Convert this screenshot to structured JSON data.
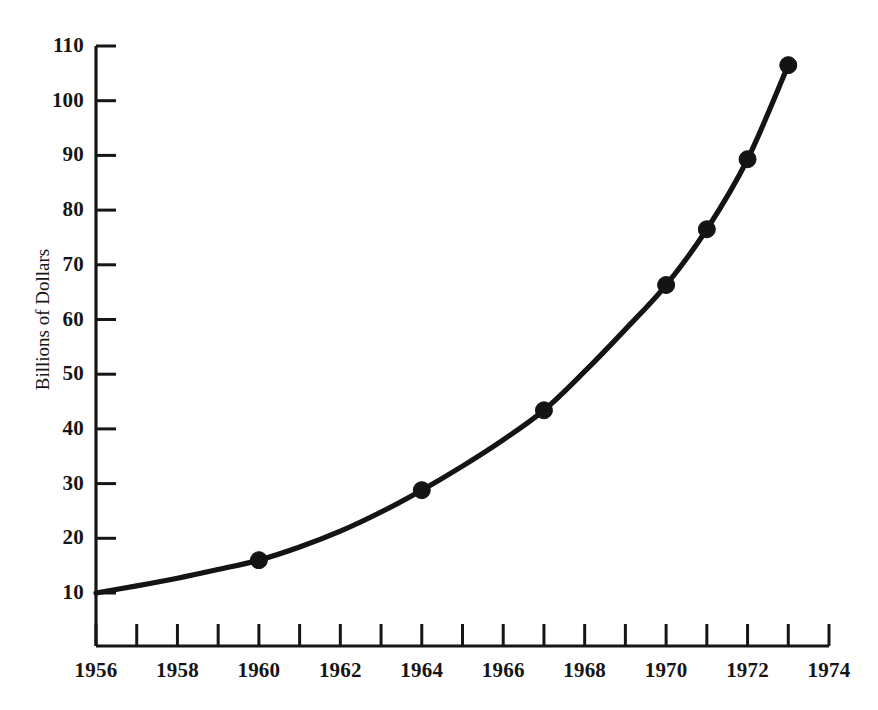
{
  "chart_data": {
    "type": "line",
    "title": "",
    "subtitle": "",
    "xlabel": "",
    "ylabel": "Billions of Dollars",
    "xlim": [
      1956,
      1974
    ],
    "ylim": [
      0,
      110
    ],
    "grid": false,
    "legend": null,
    "x_tick_labels": [
      "1956",
      "1958",
      "1960",
      "1962",
      "1964",
      "1966",
      "1968",
      "1970",
      "1972",
      "1974"
    ],
    "x_tick_values": [
      1956,
      1958,
      1960,
      1962,
      1964,
      1966,
      1968,
      1970,
      1972,
      1974
    ],
    "x_minor_ticks": [
      1957,
      1959,
      1961,
      1963,
      1965,
      1967,
      1969,
      1971,
      1973
    ],
    "y_tick_labels": [
      "10",
      "20",
      "30",
      "40",
      "50",
      "60",
      "70",
      "80",
      "90",
      "100",
      "110"
    ],
    "y_tick_values": [
      10,
      20,
      30,
      40,
      50,
      60,
      70,
      80,
      90,
      100,
      110
    ],
    "series": [
      {
        "name": "Billions of Dollars",
        "color": "#141414",
        "marker": "circle",
        "x": [
          1956,
          1960,
          1964,
          1967,
          1970,
          1971,
          1972,
          1973
        ],
        "y": [
          10.0,
          16.0,
          28.8,
          43.4,
          66.3,
          76.5,
          89.3,
          106.5
        ],
        "marked_points": [
          1960,
          1964,
          1967,
          1970,
          1971,
          1972,
          1973
        ],
        "curve_points": [
          {
            "x": 1956,
            "y": 10.0
          },
          {
            "x": 1957,
            "y": 11.3
          },
          {
            "x": 1958,
            "y": 12.7
          },
          {
            "x": 1959,
            "y": 14.3
          },
          {
            "x": 1960,
            "y": 16.0
          },
          {
            "x": 1961,
            "y": 18.4
          },
          {
            "x": 1962,
            "y": 21.3
          },
          {
            "x": 1963,
            "y": 24.8
          },
          {
            "x": 1964,
            "y": 28.8
          },
          {
            "x": 1965,
            "y": 33.2
          },
          {
            "x": 1966,
            "y": 38.0
          },
          {
            "x": 1967,
            "y": 43.4
          },
          {
            "x": 1968,
            "y": 50.5
          },
          {
            "x": 1969,
            "y": 58.2
          },
          {
            "x": 1970,
            "y": 66.3
          },
          {
            "x": 1971,
            "y": 76.5
          },
          {
            "x": 1972,
            "y": 89.3
          },
          {
            "x": 1973,
            "y": 106.5
          }
        ]
      }
    ]
  },
  "axes": {
    "y_axis_title": "Billions of Dollars"
  }
}
